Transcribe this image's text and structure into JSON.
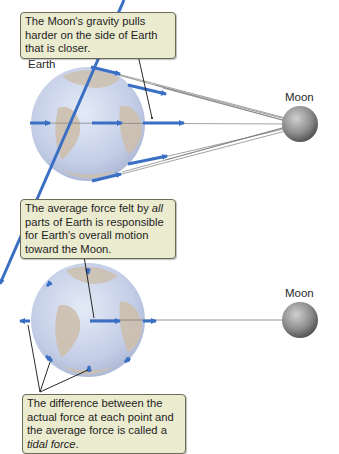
{
  "top_panel": {
    "callout": "The Moon's gravity pulls harder on the side of Earth that is closer.",
    "earth_label": "Earth",
    "moon_label": "Moon"
  },
  "bottom_panel": {
    "callout_pre": "The average force felt by ",
    "callout_em": "all",
    "callout_post": " parts of Earth is responsible for Earth's overall motion toward the Moon.",
    "moon_label": "Moon",
    "tidal_callout_pre": "The difference between the actual force at each point and the average force is called a ",
    "tidal_callout_em": "tidal force",
    "tidal_callout_post": "."
  },
  "colors": {
    "arrow": "#3a6fc4",
    "callout_bg": "#ebebd0",
    "earth_ocean": "#c9d4ea",
    "earth_land": "#cdbfae",
    "moon": "#8a8a8a"
  }
}
